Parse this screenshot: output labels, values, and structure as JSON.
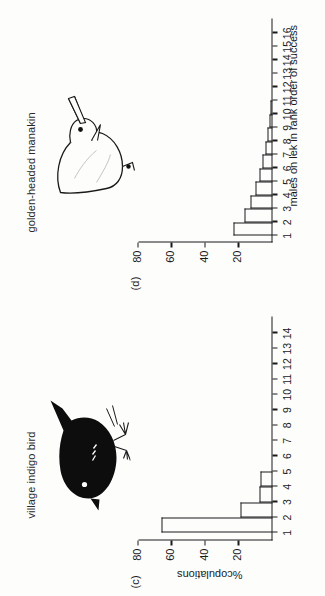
{
  "figure": {
    "axis_title_y": "%copulations",
    "axis_title_x": "males on lek in rank order of success"
  },
  "panels": [
    {
      "letter": "(c)",
      "species_label": "village indigo bird",
      "bird_icon": "village-indigo-bird-silhouette"
    },
    {
      "letter": "(d)",
      "species_label": "golden-headed manakin",
      "bird_icon": "golden-headed-manakin-outline"
    }
  ],
  "chart_data": [
    {
      "type": "bar",
      "panel": "(c)",
      "title": "village indigo bird",
      "categories": [
        "1",
        "2",
        "3",
        "4",
        "5",
        "6",
        "7",
        "8",
        "9",
        "10",
        "11",
        "12",
        "13",
        "14"
      ],
      "values": [
        66,
        19,
        8,
        7,
        0,
        0,
        0,
        0,
        0,
        0,
        0,
        0,
        0,
        0
      ],
      "xlabel": "males on lek in rank order of success",
      "ylabel": "%copulations",
      "ylim": [
        0,
        80
      ],
      "yticks": [
        20,
        40,
        60,
        80
      ],
      "grid": false,
      "legend": "none"
    },
    {
      "type": "bar",
      "panel": "(d)",
      "title": "golden-headed manakin",
      "categories": [
        "1",
        "2",
        "3",
        "4",
        "5",
        "6",
        "7",
        "8",
        "9",
        "10",
        "11",
        "12",
        "13",
        "14",
        "15",
        "16"
      ],
      "values": [
        23,
        17,
        13,
        10,
        8,
        6,
        4,
        3,
        2,
        1,
        0,
        0,
        0,
        0,
        0,
        0
      ],
      "xlabel": "males on lek in rank order of success",
      "ylabel": "%copulations",
      "ylim": [
        0,
        80
      ],
      "yticks": [
        20,
        40,
        60,
        80
      ],
      "grid": false,
      "legend": "none"
    }
  ]
}
